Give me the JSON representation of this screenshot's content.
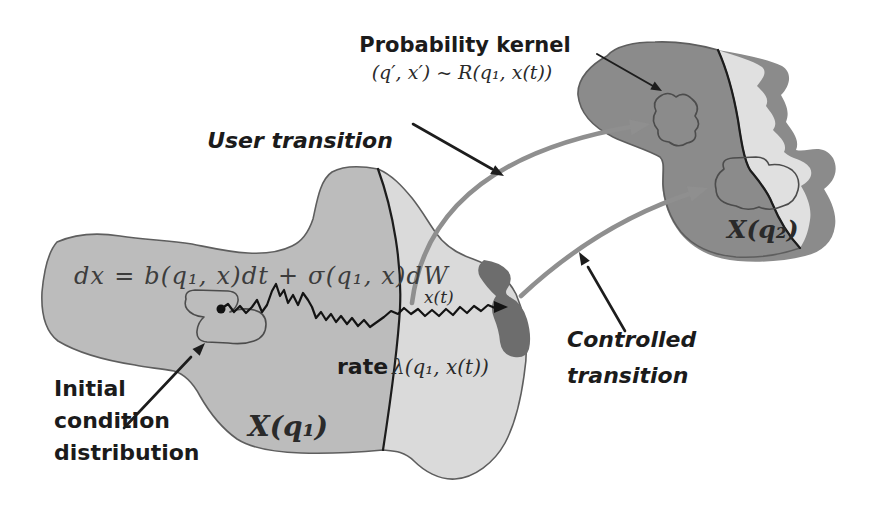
{
  "diagram": {
    "probability_kernel": {
      "label": "Probability kernel",
      "formula": "(q′, x′) ~ R(q₁, x(t))"
    },
    "annotations": {
      "user_transition": "User transition",
      "controlled_transition": [
        "Controlled",
        "transition"
      ],
      "initial_condition": [
        "Initial",
        "condition",
        "distribution"
      ]
    },
    "left_region": {
      "sde_formula": "dx = b(q₁, x)dt + σ(q₁, x)dW",
      "trajectory_label": "x(t)",
      "rate_word": "rate",
      "rate_formula": "λ(q₁, x(t))",
      "region_label": "X(q₁)"
    },
    "right_region": {
      "region_label": "X(q₂)"
    },
    "colors": {
      "left_blob": "#bcbcbc",
      "left_blob_light": "#dadada",
      "right_blob": "#c6c6c6",
      "right_blob_light": "#e0e0e0",
      "dark_band": "#8b8b8b",
      "inner_blob": "#a5a5a5",
      "init_blob": "#a2a2a2",
      "boundary_patch": "#6d6d6d",
      "transition_arrow": "#8f8f8f",
      "ink": "#1d1d1d"
    }
  }
}
